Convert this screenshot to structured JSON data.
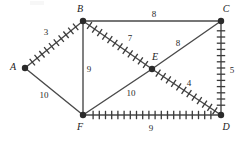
{
  "figure": {
    "type": "weighted-graph-diagram",
    "width": 245,
    "height": 143,
    "background_color": "#ffffff",
    "edge_color": "#4a4a4a",
    "hatch_color": "#3a3a3a",
    "vertex_color": "#2b2b2b",
    "text_color": "#1a1a1a"
  },
  "vertices": [
    {
      "id": "A",
      "label": "A",
      "x": 25,
      "y": 68,
      "label_x": 13,
      "label_y": 67
    },
    {
      "id": "B",
      "label": "B",
      "x": 83,
      "y": 21,
      "label_x": 80,
      "label_y": 9
    },
    {
      "id": "C",
      "label": "C",
      "x": 221,
      "y": 21,
      "label_x": 226,
      "label_y": 9
    },
    {
      "id": "D",
      "label": "D",
      "x": 221,
      "y": 115,
      "label_x": 226,
      "label_y": 127
    },
    {
      "id": "E",
      "label": "E",
      "x": 152,
      "y": 69,
      "label_x": 155,
      "label_y": 57
    },
    {
      "id": "F",
      "label": "F",
      "x": 83,
      "y": 115,
      "label_x": 80,
      "label_y": 127
    }
  ],
  "edges": [
    {
      "id": "A-B",
      "from": "A",
      "to": "B",
      "weight": "3",
      "hatched": true,
      "label_x": 46,
      "label_y": 32
    },
    {
      "id": "B-C",
      "from": "B",
      "to": "C",
      "weight": "8",
      "hatched": false,
      "label_x": 154,
      "label_y": 14
    },
    {
      "id": "B-E",
      "from": "B",
      "to": "E",
      "weight": "7",
      "hatched": true,
      "label_x": 130,
      "label_y": 38
    },
    {
      "id": "B-F",
      "from": "B",
      "to": "F",
      "weight": "9",
      "hatched": false,
      "label_x": 89,
      "label_y": 69
    },
    {
      "id": "C-E",
      "from": "C",
      "to": "E",
      "weight": "8",
      "hatched": false,
      "label_x": 178,
      "label_y": 43
    },
    {
      "id": "C-D",
      "from": "C",
      "to": "D",
      "weight": "5",
      "hatched": true,
      "label_x": 232,
      "label_y": 70
    },
    {
      "id": "E-D",
      "from": "E",
      "to": "D",
      "weight": "4",
      "hatched": true,
      "label_x": 189,
      "label_y": 83
    },
    {
      "id": "A-F",
      "from": "A",
      "to": "F",
      "weight": "10",
      "hatched": false,
      "label_x": 44,
      "label_y": 95
    },
    {
      "id": "F-E",
      "from": "F",
      "to": "E",
      "weight": "10",
      "hatched": false,
      "label_x": 131,
      "label_y": 93
    },
    {
      "id": "F-D",
      "from": "F",
      "to": "D",
      "weight": "9",
      "hatched": true,
      "label_x": 151,
      "label_y": 128
    }
  ]
}
